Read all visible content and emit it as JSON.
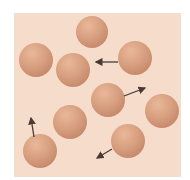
{
  "figure": {
    "background_color": "#f6dccb",
    "sphere_color": "#d79f7f",
    "arrow_color": "#4a3a35",
    "spheres": [
      {
        "id": 1,
        "cx": 92,
        "cy": 32,
        "r": 16
      },
      {
        "id": 2,
        "cx": 36,
        "cy": 60,
        "r": 17
      },
      {
        "id": 3,
        "cx": 73,
        "cy": 70,
        "r": 17
      },
      {
        "id": 4,
        "cx": 135,
        "cy": 58,
        "r": 17
      },
      {
        "id": 5,
        "cx": 108,
        "cy": 100,
        "r": 17
      },
      {
        "id": 6,
        "cx": 162,
        "cy": 111,
        "r": 17
      },
      {
        "id": 7,
        "cx": 70,
        "cy": 122,
        "r": 17
      },
      {
        "id": 8,
        "cx": 128,
        "cy": 141,
        "r": 17
      },
      {
        "id": 9,
        "cx": 40,
        "cy": 151,
        "r": 17
      }
    ],
    "arrows": [
      {
        "from": [
          118,
          62
        ],
        "to": [
          96,
          62
        ]
      },
      {
        "from": [
          124,
          96
        ],
        "to": [
          145,
          88
        ]
      },
      {
        "from": [
          34,
          137
        ],
        "to": [
          31,
          118
        ]
      },
      {
        "from": [
          112,
          149
        ],
        "to": [
          97,
          158
        ]
      }
    ]
  }
}
